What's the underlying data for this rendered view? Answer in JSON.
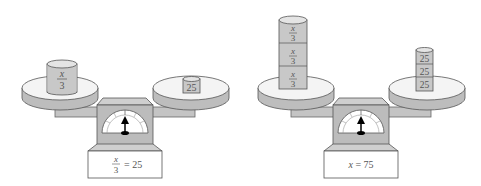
{
  "scales": [
    {
      "left_pan": {
        "items": [
          {
            "num": "x",
            "den": "3"
          }
        ]
      },
      "right_pan": {
        "items": [
          "25"
        ]
      },
      "equation": {
        "lhs_num": "x",
        "lhs_den": "3",
        "rhs": "= 25"
      }
    },
    {
      "left_pan": {
        "items": [
          {
            "num": "x",
            "den": "3"
          },
          {
            "num": "x",
            "den": "3"
          },
          {
            "num": "x",
            "den": "3"
          }
        ]
      },
      "right_pan": {
        "items": [
          "25",
          "25",
          "25"
        ]
      },
      "equation": {
        "var": "x",
        "rhs": " = 75"
      }
    }
  ],
  "colors": {
    "cylinder": "#c8c8c8",
    "pan_top": "#f4f4f4",
    "pan_side": "#bdbdbd",
    "box": "#bcbcbc",
    "outline": "#555555"
  }
}
